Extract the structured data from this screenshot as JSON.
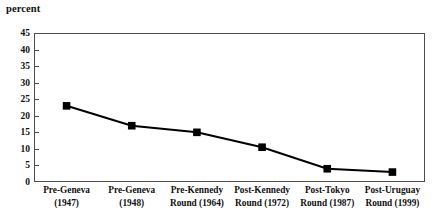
{
  "chart_data": {
    "type": "line",
    "title": "",
    "subtitle": "",
    "xlabel": "",
    "ylabel": "percent",
    "ylim": [
      0,
      45
    ],
    "yticks": [
      45,
      40,
      35,
      30,
      25,
      20,
      15,
      10,
      5,
      0
    ],
    "ytick_labels": [
      "45",
      "40",
      "35",
      "30",
      "25",
      "20",
      "15",
      "10",
      "5",
      "0"
    ],
    "grid": false,
    "legend": false,
    "legend_position": "none",
    "marker": "square",
    "marker_color": "#000000",
    "line_color": "#000000",
    "categories": [
      "Pre-Geneva (1947)",
      "Pre-Geneva (1948)",
      "Pre-Kennedy Round (1964)",
      "Post-Kennedy Round (1972)",
      "Post-Tokyo Round (1987)",
      "Post-Uruguay Round (1999)"
    ],
    "category_lines": [
      [
        "Pre-Geneva",
        "(1947)"
      ],
      [
        "Pre-Geneva",
        "(1948)"
      ],
      [
        "Pre-Kennedy",
        "Round (1964)"
      ],
      [
        "Post-Kennedy",
        "Round (1972)"
      ],
      [
        "Post-Tokyo",
        "Round (1987)"
      ],
      [
        "Post-Uruguay",
        "Round (1999)"
      ]
    ],
    "values": [
      23,
      17,
      15,
      10.5,
      4,
      3
    ]
  }
}
